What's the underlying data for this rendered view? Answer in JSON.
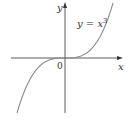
{
  "figure": {
    "curve_label_prefix": "y = x",
    "curve_label_exponent": "3",
    "x_axis_label": "x",
    "y_axis_label": "y",
    "origin_label": "0",
    "colors": {
      "axis": "#333333",
      "curve": "#8a8a8a",
      "background": "#ffffff"
    }
  }
}
